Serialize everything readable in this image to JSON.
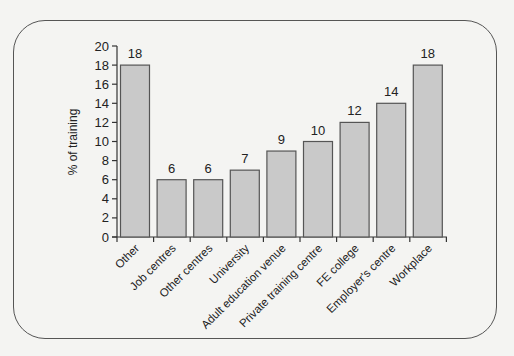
{
  "chart_data": {
    "type": "bar",
    "title": "",
    "xlabel": "",
    "ylabel": "% of training",
    "ylim": [
      0,
      20
    ],
    "yticks": [
      0,
      2,
      4,
      6,
      8,
      10,
      12,
      14,
      16,
      18,
      20
    ],
    "grid": false,
    "legend": null,
    "categories": [
      "Other",
      "Job centres",
      "Other centres",
      "University",
      "Adult education venue",
      "Private training centre",
      "FE college",
      "Employer's centre",
      "Workplace"
    ],
    "values": [
      18,
      6,
      6,
      7,
      9,
      10,
      12,
      14,
      18
    ],
    "data_labels": [
      "18",
      "6",
      "6",
      "7",
      "9",
      "10",
      "12",
      "14",
      "18"
    ],
    "bar_fill": "#c9c9c9",
    "bar_stroke": "#555555"
  }
}
